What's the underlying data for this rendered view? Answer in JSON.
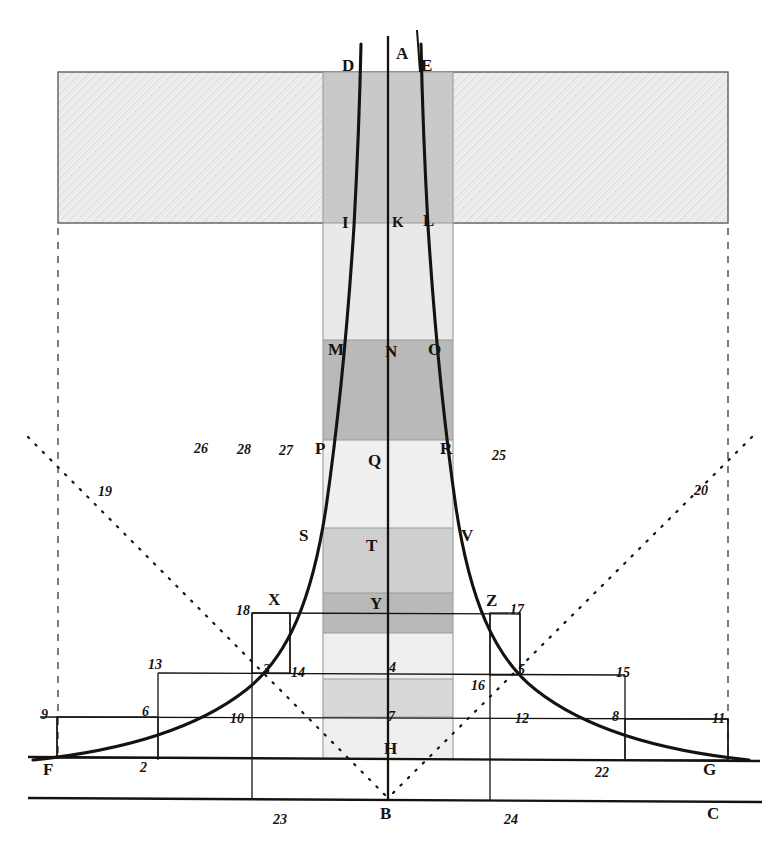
{
  "figure": {
    "width": 780,
    "height": 859,
    "background_color": "#ffffff",
    "ink_color": "#16120f"
  },
  "palette": {
    "ink": "#16120f",
    "hatch_band": "#e8e8e8",
    "hatch_band_border": "#6f6f6f",
    "column_light": "#efefef",
    "column_mid": "#d8d8d8",
    "column_dark": "#b9b9b9",
    "column_border": "#9a9a9a",
    "thin_rule": "#16120f"
  },
  "geometry": {
    "column_left_x": 323,
    "column_right_x": 453,
    "axis_x": 388,
    "baseline_y": 800,
    "ground_y": 760,
    "hatch_band_top_y": 72,
    "hatch_band_bottom_y": 223,
    "hatch_band_left_x": 58,
    "hatch_band_right_x": 728
  },
  "column_bands": [
    {
      "name": "band-D-I",
      "top": 72,
      "bottom": 223,
      "shade": "column_mid"
    },
    {
      "name": "band-I-M",
      "top": 223,
      "bottom": 340,
      "shade": "column_light"
    },
    {
      "name": "band-M-P",
      "top": 340,
      "bottom": 440,
      "shade": "column_dark"
    },
    {
      "name": "band-P-S",
      "top": 440,
      "bottom": 528,
      "shade": "column_light"
    },
    {
      "name": "band-S-Y",
      "top": 528,
      "bottom": 593,
      "shade": "column_mid"
    },
    {
      "name": "band-Y-4",
      "top": 593,
      "bottom": 633,
      "shade": "column_dark"
    },
    {
      "name": "band-4-7",
      "top": 633,
      "bottom": 679,
      "shade": "column_light"
    },
    {
      "name": "band-7-H",
      "top": 679,
      "bottom": 717,
      "shade": "column_mid"
    },
    {
      "name": "band-H-bot",
      "top": 717,
      "bottom": 760,
      "shade": "column_light"
    }
  ],
  "letter_labels": [
    {
      "id": "A",
      "text": "A",
      "x": 396,
      "y": 52
    },
    {
      "id": "D",
      "text": "D",
      "x": 342,
      "y": 64
    },
    {
      "id": "E",
      "text": "E",
      "x": 421,
      "y": 64
    },
    {
      "id": "I",
      "text": "I",
      "x": 342,
      "y": 216
    },
    {
      "id": "K",
      "text": "K",
      "x": 393,
      "y": 216
    },
    {
      "id": "L",
      "text": "L",
      "x": 423,
      "y": 214
    },
    {
      "id": "M",
      "text": "M",
      "x": 330,
      "y": 342
    },
    {
      "id": "N",
      "text": "N",
      "x": 386,
      "y": 344
    },
    {
      "id": "O",
      "text": "O",
      "x": 428,
      "y": 342
    },
    {
      "id": "P",
      "text": "P",
      "x": 316,
      "y": 441
    },
    {
      "id": "Q",
      "text": "Q",
      "x": 369,
      "y": 453
    },
    {
      "id": "R",
      "text": "R",
      "x": 441,
      "y": 441
    },
    {
      "id": "S",
      "text": "S",
      "x": 300,
      "y": 528
    },
    {
      "id": "T",
      "text": "T",
      "x": 367,
      "y": 538
    },
    {
      "id": "V",
      "text": "V",
      "x": 461,
      "y": 528
    },
    {
      "id": "X",
      "text": "X",
      "x": 269,
      "y": 593
    },
    {
      "id": "Y",
      "text": "Y",
      "x": 371,
      "y": 596
    },
    {
      "id": "Z",
      "text": "Z",
      "x": 487,
      "y": 594
    },
    {
      "id": "H",
      "text": "H",
      "x": 385,
      "y": 741
    },
    {
      "id": "F",
      "text": "F",
      "x": 44,
      "y": 762
    },
    {
      "id": "G",
      "text": "G",
      "x": 703,
      "y": 762
    },
    {
      "id": "B",
      "text": "B",
      "x": 381,
      "y": 806
    },
    {
      "id": "C",
      "text": "C",
      "x": 708,
      "y": 806
    }
  ],
  "number_labels": [
    {
      "id": "n2",
      "text": "2",
      "x": 141,
      "y": 762
    },
    {
      "id": "n3",
      "text": "3",
      "x": 264,
      "y": 664
    },
    {
      "id": "n4",
      "text": "4",
      "x": 390,
      "y": 662
    },
    {
      "id": "n5",
      "text": "5",
      "x": 519,
      "y": 664
    },
    {
      "id": "n6",
      "text": "6",
      "x": 143,
      "y": 706
    },
    {
      "id": "n7",
      "text": "7",
      "x": 389,
      "y": 711
    },
    {
      "id": "n8",
      "text": "8",
      "x": 613,
      "y": 711
    },
    {
      "id": "n9",
      "text": "9",
      "x": 42,
      "y": 709
    },
    {
      "id": "n10",
      "text": "10",
      "x": 231,
      "y": 713
    },
    {
      "id": "n11",
      "text": "11",
      "x": 713,
      "y": 713
    },
    {
      "id": "n12",
      "text": "12",
      "x": 516,
      "y": 713
    },
    {
      "id": "n13",
      "text": "13",
      "x": 149,
      "y": 659
    },
    {
      "id": "n14",
      "text": "14",
      "x": 292,
      "y": 667
    },
    {
      "id": "n15",
      "text": "15",
      "x": 617,
      "y": 667
    },
    {
      "id": "n16",
      "text": "16",
      "x": 472,
      "y": 680
    },
    {
      "id": "n17",
      "text": "17",
      "x": 511,
      "y": 604
    },
    {
      "id": "n18",
      "text": "18",
      "x": 237,
      "y": 605
    },
    {
      "id": "n19",
      "text": "19",
      "x": 99,
      "y": 486
    },
    {
      "id": "n20",
      "text": "20",
      "x": 695,
      "y": 485
    },
    {
      "id": "n22",
      "text": "22",
      "x": 596,
      "y": 767
    },
    {
      "id": "n23",
      "text": "23",
      "x": 274,
      "y": 814
    },
    {
      "id": "n24",
      "text": "24",
      "x": 505,
      "y": 814
    },
    {
      "id": "n25",
      "text": "25",
      "x": 493,
      "y": 450
    },
    {
      "id": "n26",
      "text": "26",
      "x": 195,
      "y": 443
    },
    {
      "id": "n27",
      "text": "27",
      "x": 280,
      "y": 445
    },
    {
      "id": "n28",
      "text": "28",
      "x": 238,
      "y": 444
    }
  ],
  "curves": {
    "left_curve": "M 55,757 C 130,749 200,728 252,684 C 292,650 316,585 332,480 C 344,396 351,300 356,200 C 359,130 361,82 362,46",
    "right_curve": "M 727,757 C 652,749 582,728 530,684 C 490,650 466,585 450,480 C 438,396 431,300 426,200 C 423,130 421,82 420,46",
    "axis_line": "M 388,36 L 388,800"
  },
  "dotted_lines": {
    "left_diagonal": "M 28,437 L 388,798",
    "right_diagonal": "M 752,437 L 388,798"
  },
  "dashed_verticals": [
    {
      "id": "left-dashed",
      "x": 58,
      "y1": 228,
      "y2": 760
    },
    {
      "id": "right-dashed",
      "x": 728,
      "y1": 228,
      "y2": 760
    }
  ],
  "rules": {
    "baseline": {
      "x1": 28,
      "y1": 799,
      "x2": 760,
      "y2": 802
    },
    "ground_line": {
      "x1": 28,
      "y1": 758,
      "x2": 760,
      "y2": 761
    },
    "level_9_11": {
      "x1": 40,
      "y1": 717,
      "x2": 728,
      "y2": 719
    },
    "level_13_15": {
      "x1": 158,
      "y1": 673,
      "x2": 625,
      "y2": 675
    },
    "level_18_17": {
      "x1": 252,
      "y1": 613,
      "x2": 520,
      "y2": 614
    }
  }
}
